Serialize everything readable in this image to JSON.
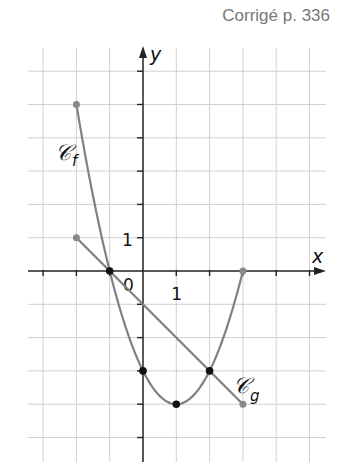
{
  "header": {
    "corrige": "Corrigé p. 336"
  },
  "colors": {
    "curve": "#808080",
    "grid": "#d0d0d0",
    "axis": "#222222",
    "point_black": "#111111",
    "point_gray": "#888888"
  },
  "chart_data": {
    "type": "line",
    "title": "",
    "xlabel": "x",
    "ylabel": "y",
    "xlim": [
      -3,
      5
    ],
    "ylim": [
      -5,
      6
    ],
    "grid": true,
    "tick_labels": {
      "origin": "0",
      "x_one": "1",
      "y_one": "1"
    },
    "series": [
      {
        "name": "Cf",
        "label": "𝒞f",
        "kind": "curve",
        "points": [
          [
            -2,
            5
          ],
          [
            -1,
            0
          ],
          [
            0,
            -3
          ],
          [
            1,
            -4
          ],
          [
            2,
            -3
          ],
          [
            3,
            0
          ]
        ],
        "endpoints": [
          [
            -2,
            5
          ],
          [
            3,
            0
          ]
        ]
      },
      {
        "name": "Cg",
        "label": "𝒞g",
        "kind": "line",
        "points": [
          [
            -2,
            1
          ],
          [
            3,
            -4
          ]
        ],
        "endpoints": [
          [
            -2,
            1
          ],
          [
            3,
            -4
          ]
        ]
      }
    ],
    "marked_points": [
      [
        -1,
        0
      ],
      [
        0,
        -3
      ],
      [
        1,
        -4
      ],
      [
        2,
        -3
      ]
    ]
  }
}
